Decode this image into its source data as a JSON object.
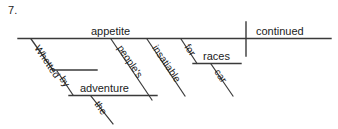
{
  "page": {
    "item_number": "7.",
    "background_color": "#ffffff",
    "ink_color": "#3a3a3a",
    "text_color": "#1b1b1b"
  },
  "diagram": {
    "type": "reed-kellogg-sentence-diagram",
    "sentence": "Whetted by the adventure, people's insatiable appetite for car races continued.",
    "baseline": {
      "subject": "appetite",
      "verb": "continued"
    },
    "words": {
      "subject": "appetite",
      "verb": "continued",
      "subject_possessive": "people's",
      "subject_adjective": "insatiable",
      "preposition": "for",
      "prep_object": "races",
      "prep_object_modifier": "car",
      "participle": "Whetted",
      "participle_preposition": "by",
      "participle_prep_object": "adventure",
      "participle_object_article": "the"
    }
  }
}
